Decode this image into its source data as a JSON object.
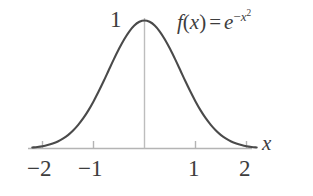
{
  "figure": {
    "background_color": "#ffffff",
    "width": 313,
    "height": 196
  },
  "formula": {
    "fn_name": "f",
    "open_paren": "(",
    "variable": "x",
    "close_paren": ")",
    "equals": "=",
    "base": "e",
    "exponent_sign": "−",
    "exponent_variable": "x",
    "exponent_power": "2",
    "plain": "f(x) = e^(-x^2)"
  },
  "axes": {
    "x_axis_name": "x",
    "y_peak_label": "1",
    "axis_color": "#b4b4b4",
    "curve_color": "#4a4a4a",
    "tick_labels": [
      {
        "text": "−2",
        "value": -2
      },
      {
        "text": "−1",
        "value": -1
      },
      {
        "text": "1",
        "value": 1
      },
      {
        "text": "2",
        "value": 2
      }
    ]
  },
  "chart_data": {
    "type": "line",
    "title": "",
    "subtitle": "",
    "xlabel": "x",
    "ylabel": "",
    "annotations": [
      {
        "text": "f(x) = e^(-x^2)",
        "x": 1.45,
        "y": 0.92
      },
      {
        "text": "1",
        "x": -0.18,
        "y": 1.0
      }
    ],
    "grid": false,
    "legend": null,
    "xlim": [
      -2.2,
      2.2
    ],
    "ylim": [
      0,
      1.05
    ],
    "xticks": [
      -2,
      -1,
      1,
      2
    ],
    "xticklabels": [
      "−2",
      "−1",
      "1",
      "2"
    ],
    "yticks": [
      1
    ],
    "yticklabels": [
      "1"
    ],
    "series": [
      {
        "name": "f(x) = e^(-x^2)",
        "color": "#4a4a4a",
        "x": [
          -2.2,
          -2.1,
          -2.0,
          -1.9,
          -1.8,
          -1.7,
          -1.6,
          -1.5,
          -1.4,
          -1.3,
          -1.2,
          -1.1,
          -1.0,
          -0.9,
          -0.8,
          -0.7,
          -0.6,
          -0.5,
          -0.4,
          -0.3,
          -0.2,
          -0.1,
          0.0,
          0.1,
          0.2,
          0.3,
          0.4,
          0.5,
          0.6,
          0.7,
          0.8,
          0.9,
          1.0,
          1.1,
          1.2,
          1.3,
          1.4,
          1.5,
          1.6,
          1.7,
          1.8,
          1.9,
          2.0,
          2.1,
          2.2
        ],
        "y": [
          0.008,
          0.012,
          0.018,
          0.027,
          0.039,
          0.055,
          0.077,
          0.105,
          0.141,
          0.185,
          0.237,
          0.298,
          0.368,
          0.445,
          0.527,
          0.613,
          0.698,
          0.779,
          0.852,
          0.914,
          0.961,
          0.99,
          1.0,
          0.99,
          0.961,
          0.914,
          0.852,
          0.779,
          0.698,
          0.613,
          0.527,
          0.445,
          0.368,
          0.298,
          0.237,
          0.185,
          0.141,
          0.105,
          0.077,
          0.055,
          0.039,
          0.027,
          0.018,
          0.012,
          0.008
        ]
      }
    ]
  }
}
